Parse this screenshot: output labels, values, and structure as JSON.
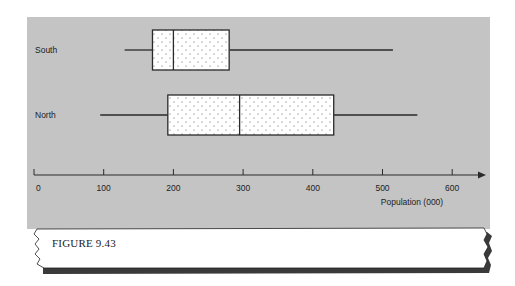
{
  "figure": {
    "caption": "FIGURE 9.43",
    "panel_color": "#c4c4c4",
    "box_fill": "#ffffff",
    "stroke_color": "#2a2a2a"
  },
  "chart_data": {
    "type": "boxplot",
    "title": "",
    "xlabel": "Population (000)",
    "ylabel": "",
    "xlim": [
      0,
      650
    ],
    "x_ticks": [
      0,
      100,
      200,
      300,
      400,
      500,
      600
    ],
    "x_tick_labels": [
      "0",
      "100",
      "200",
      "300",
      "400",
      "500",
      "600"
    ],
    "grid": false,
    "legend": null,
    "categories": [
      "South",
      "North"
    ],
    "series": [
      {
        "name": "South",
        "min": 130,
        "q1": 170,
        "median": 200,
        "q3": 280,
        "max": 515
      },
      {
        "name": "North",
        "min": 95,
        "q1": 192,
        "median": 295,
        "q3": 430,
        "max": 550
      }
    ]
  }
}
